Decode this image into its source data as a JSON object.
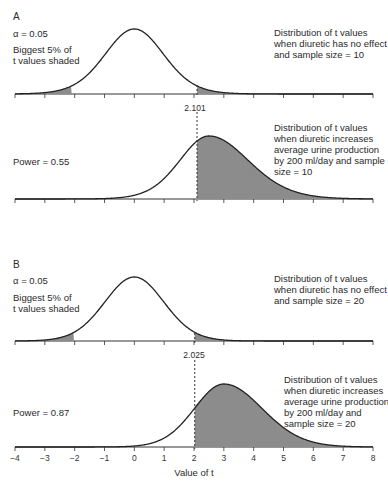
{
  "chart_data": {
    "type": "area",
    "title": "",
    "xlabel": "Value of t",
    "ylabel": "",
    "xlim": [
      -4,
      8
    ],
    "x_ticks": [
      -4,
      -3,
      -2,
      -1,
      0,
      1,
      2,
      3,
      4,
      5,
      6,
      7,
      8
    ],
    "x_tick_labels": [
      "−4",
      "−3",
      "−2",
      "−1",
      "0",
      "1",
      "2",
      "3",
      "4",
      "5",
      "6",
      "7",
      "8"
    ],
    "grid": false,
    "shade_color": "#8c8c8c",
    "line_color": "#222222",
    "panels": [
      {
        "letter": "A",
        "alpha_label": "α = 0.05",
        "shaded_note": [
          "Biggest 5% of",
          "t values shaded"
        ],
        "critical_value": 2.101,
        "critical_label": "2.101",
        "null_distribution": {
          "description": [
            "Distribution of t values",
            "when diuretic has no effect",
            "and sample size = 10"
          ],
          "center": 0,
          "df": 18,
          "shaded_tails": "both (2.5% each)"
        },
        "alt_distribution": {
          "description": [
            "Distribution of t values",
            "when diuretic increases",
            "average urine production",
            "by 200 ml/day and sample",
            "size = 10"
          ],
          "center": 2.5,
          "df": 18,
          "shaded_from": 2.101
        },
        "power_label": "Power = 0.55",
        "power": 0.55
      },
      {
        "letter": "B",
        "alpha_label": "α = 0.05",
        "shaded_note": [
          "Biggest 5% of",
          "t values shaded"
        ],
        "critical_value": 2.025,
        "critical_label": "2.025",
        "null_distribution": {
          "description": [
            "Distribution of t values",
            "when diuretic has no effect",
            "and sample size = 20"
          ],
          "center": 0,
          "df": 38,
          "shaded_tails": "both (2.5% each)"
        },
        "alt_distribution": {
          "description": [
            "Distribution of t values",
            "when diuretic increases",
            "average urine production",
            "by 200 ml/day and",
            "sample size = 20"
          ],
          "center": 3.0,
          "df": 38,
          "shaded_from": 2.025
        },
        "power_label": "Power = 0.87",
        "power": 0.87
      }
    ]
  }
}
